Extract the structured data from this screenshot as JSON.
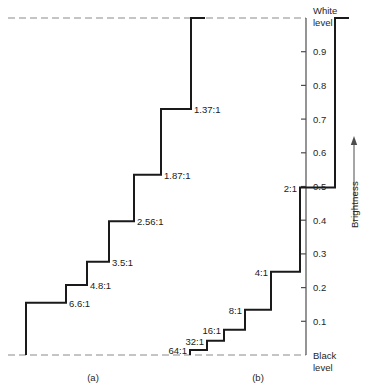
{
  "chart_data": {
    "type": "line",
    "title": "",
    "xlabel": "",
    "ylabel": "Brightness",
    "ylim": [
      0,
      1
    ],
    "grid": false,
    "legend": null,
    "axis": {
      "position": "right",
      "title": "Brightness",
      "top_label_line1": "White",
      "top_label_line2": "level",
      "bottom_label_line1": "Black",
      "bottom_label_line2": "level",
      "tick_labels": [
        "0.9",
        "0.8",
        "0.7",
        "0.6",
        "0.5",
        "0.4",
        "0.3",
        "0.2",
        "0.1"
      ],
      "tick_values": [
        0.9,
        0.8,
        0.7,
        0.6,
        0.5,
        0.4,
        0.3,
        0.2,
        0.1
      ]
    },
    "series": [
      {
        "name": "a",
        "caption": "(a)",
        "steps": [
          {
            "label": "6.6:1",
            "brightness": 0.155
          },
          {
            "label": "4.8:1",
            "brightness": 0.208
          },
          {
            "label": "3.5:1",
            "brightness": 0.277
          },
          {
            "label": "2.56:1",
            "brightness": 0.397
          },
          {
            "label": "1.87:1",
            "brightness": 0.535
          },
          {
            "label": "1.37:1",
            "brightness": 0.73
          },
          {
            "label": "",
            "brightness": 1.0
          }
        ]
      },
      {
        "name": "b",
        "caption": "(b)",
        "steps": [
          {
            "label": "64:1",
            "brightness": 0.015
          },
          {
            "label": "32:1",
            "brightness": 0.042
          },
          {
            "label": "16:1",
            "brightness": 0.075
          },
          {
            "label": "8:1",
            "brightness": 0.134
          },
          {
            "label": "4:1",
            "brightness": 0.247
          },
          {
            "label": "2:1",
            "brightness": 0.497
          },
          {
            "label": "",
            "brightness": 1.0
          }
        ]
      }
    ]
  }
}
